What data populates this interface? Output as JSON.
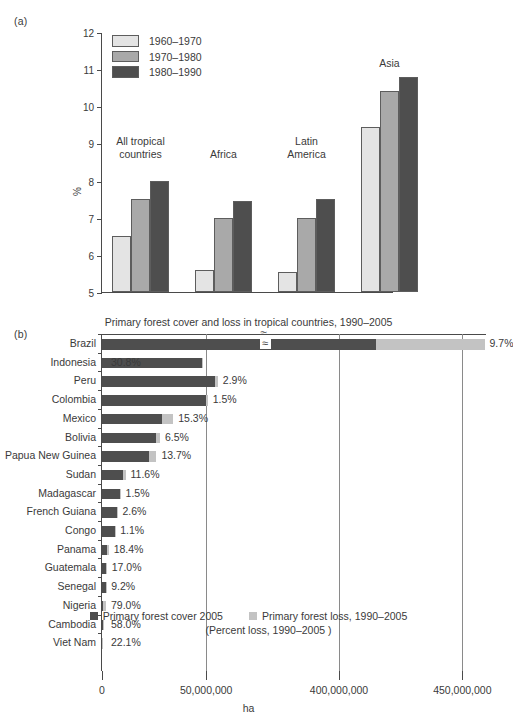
{
  "figure": {
    "panel_a_letter": "(a)",
    "panel_b_letter": "(b)"
  },
  "chart_data": [
    {
      "type": "bar",
      "panel": "(a)",
      "title": "",
      "xlabel": "",
      "ylabel": "%",
      "ylim": [
        5,
        12
      ],
      "yticks": [
        "5",
        "6",
        "7",
        "8",
        "9",
        "10",
        "11",
        "12"
      ],
      "grid": false,
      "legend_position": "top-left",
      "categories": [
        "All tropical\ncountries",
        "Africa",
        "Latin\nAmerica",
        "Asia"
      ],
      "series": [
        {
          "name": "1960–1970",
          "color": "#e4e4e4",
          "values": [
            6.5,
            5.6,
            5.55,
            9.45
          ]
        },
        {
          "name": "1970–1980",
          "color": "#a9a9a9",
          "values": [
            7.5,
            7.0,
            7.0,
            10.4
          ]
        },
        {
          "name": "1980–1990",
          "color": "#4e4e4e",
          "values": [
            8.0,
            7.45,
            7.5,
            10.8
          ]
        }
      ]
    },
    {
      "type": "bar",
      "panel": "(b)",
      "orientation": "horizontal",
      "title": "Primary forest cover and loss in tropical countries, 1990–2005",
      "xlabel": "ha",
      "ylabel": "",
      "grid": true,
      "axis_break": true,
      "xticks": [
        "0",
        "50,000,000",
        "400,000,000",
        "450,000,000"
      ],
      "xtick_values": [
        0,
        50000000,
        400000000,
        450000000
      ],
      "legend": [
        {
          "label": "Primary forest cover 2005",
          "color": "#4e4e4e"
        },
        {
          "label": "Primary forest loss, 1990–2005",
          "color": "#c3c3c3"
        }
      ],
      "legend_note": "(Percent loss, 1990–2005 )",
      "rows": [
        {
          "country": "Brazil",
          "cover": 415000000,
          "loss": 44000000,
          "percent": "9.7%"
        },
        {
          "country": "Indonesia",
          "cover": 48000000,
          "loss": 21000000,
          "percent": "30.8%"
        },
        {
          "country": "Peru",
          "cover": 54000000,
          "loss": 1600000,
          "percent": "2.9%"
        },
        {
          "country": "Colombia",
          "cover": 50000000,
          "loss": 760000,
          "percent": "1.5%"
        },
        {
          "country": "Mexico",
          "cover": 29000000,
          "loss": 5200000,
          "percent": "15.3%"
        },
        {
          "country": "Bolivia",
          "cover": 26000000,
          "loss": 1800000,
          "percent": "6.5%"
        },
        {
          "country": "Papua New Guinea",
          "cover": 22500000,
          "loss": 3600000,
          "percent": "13.7%"
        },
        {
          "country": "Sudan",
          "cover": 10000000,
          "loss": 1300000,
          "percent": "11.6%"
        },
        {
          "country": "Madagascar",
          "cover": 8800000,
          "loss": 130000,
          "percent": "1.5%"
        },
        {
          "country": "French Guiana",
          "cover": 7200000,
          "loss": 190000,
          "percent": "2.6%"
        },
        {
          "country": "Congo",
          "cover": 6300000,
          "loss": 70000,
          "percent": "1.1%"
        },
        {
          "country": "Panama",
          "cover": 2600000,
          "loss": 590000,
          "percent": "18.4%"
        },
        {
          "country": "Guatemala",
          "cover": 1900000,
          "loss": 390000,
          "percent": "17.0%"
        },
        {
          "country": "Senegal",
          "cover": 1800000,
          "loss": 180000,
          "percent": "9.2%"
        },
        {
          "country": "Nigeria",
          "cover": 380000,
          "loss": 1400000,
          "percent": "79.0%"
        },
        {
          "country": "Cambodia",
          "cover": 320000,
          "loss": 440000,
          "percent": "58.0%"
        },
        {
          "country": "Viet Nam",
          "cover": 85000,
          "loss": 24000,
          "percent": "22.1%"
        }
      ]
    }
  ]
}
